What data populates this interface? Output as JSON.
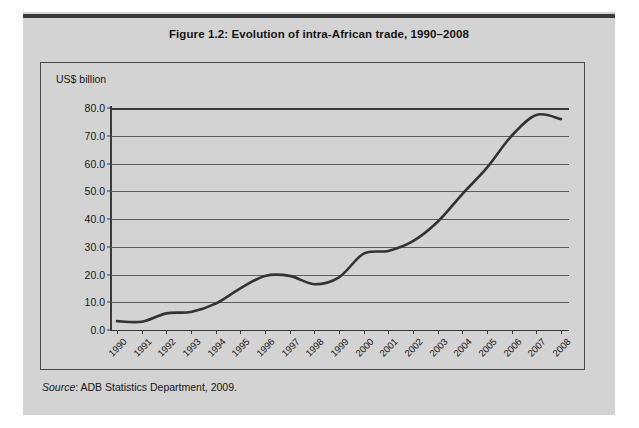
{
  "figure": {
    "title": "Figure 1.2:  Evolution of intra-African trade, 1990–2008",
    "unit_label": "US$ billion",
    "source_prefix": "Source",
    "source_text": ": ADB Statistics Department, 2009."
  },
  "colors": {
    "panel_background": "#d3d3d3",
    "page_background": "#ffffff",
    "top_rule": "#3b3b3b",
    "box_border": "#4a4a4a",
    "gridline": "#5d5d5d",
    "axis": "#3a3a3a",
    "series_line": "#333333",
    "text": "#161616"
  },
  "chart_data": {
    "type": "line",
    "title": "Figure 1.2:  Evolution of intra-African trade, 1990–2008",
    "xlabel": "",
    "ylabel": "US$ billion",
    "ylim": [
      0,
      80
    ],
    "ytick_labels": [
      "0.0",
      "10.0",
      "20.0",
      "30.0",
      "40.0",
      "50.0",
      "60.0",
      "70.0",
      "80.0"
    ],
    "ytick_values": [
      0,
      10,
      20,
      30,
      40,
      50,
      60,
      70,
      80
    ],
    "grid": true,
    "legend": "none",
    "categories": [
      "1990",
      "1991",
      "1992",
      "1993",
      "1994",
      "1995",
      "1996",
      "1997",
      "1998",
      "1999",
      "2000",
      "2001",
      "2002",
      "2003",
      "2004",
      "2005",
      "2006",
      "2007",
      "2008"
    ],
    "values": [
      3.2,
      3.0,
      6.0,
      6.5,
      9.5,
      15.0,
      19.5,
      19.5,
      16.5,
      19.0,
      27.5,
      28.5,
      32.0,
      39.0,
      49.0,
      58.5,
      70.0,
      77.5,
      76.0
    ],
    "series": [
      {
        "name": "Intra-African trade",
        "values": [
          3.2,
          3.0,
          6.0,
          6.5,
          9.5,
          15.0,
          19.5,
          19.5,
          16.5,
          19.0,
          27.5,
          28.5,
          32.0,
          39.0,
          49.0,
          58.5,
          70.0,
          77.5,
          76.0
        ]
      }
    ]
  }
}
